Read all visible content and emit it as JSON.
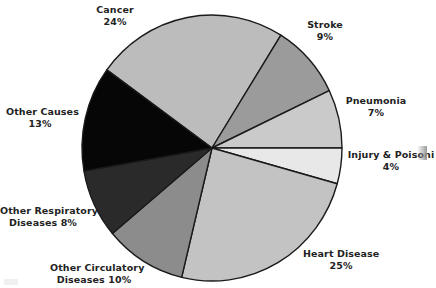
{
  "chart_data": {
    "type": "pie",
    "title": "",
    "slices": [
      {
        "label": "Cancer",
        "value": 24,
        "pct_label": "24%",
        "color": "#bcbcbc",
        "start": -144,
        "end": -58
      },
      {
        "label": "Stroke",
        "value": 9,
        "pct_label": "9%",
        "color": "#9b9b9b",
        "start": -58,
        "end": -25.6
      },
      {
        "label": "Pneumonia",
        "value": 7,
        "pct_label": "7%",
        "color": "#cacaca",
        "start": -25.6,
        "end": 0
      },
      {
        "label": "Injury & Poisoning",
        "value": 4,
        "pct_label": "4%",
        "color": "#e8e8e8",
        "start": 0,
        "end": 15.6
      },
      {
        "label": "Heart Disease",
        "value": 25,
        "pct_label": "25%",
        "color": "#c3c3c3",
        "start": 15.6,
        "end": 103.5
      },
      {
        "label": "Other Circulatory Diseases",
        "value": 10,
        "pct_label": "10%",
        "color": "#8c8c8c",
        "start": 103.5,
        "end": 140
      },
      {
        "label": "Other Respiratory Diseases",
        "value": 8,
        "pct_label": "8%",
        "color": "#2a2a2a",
        "start": 140,
        "end": 170
      },
      {
        "label": "Other Causes",
        "value": 13,
        "pct_label": "13%",
        "color": "#060606",
        "start": 170,
        "end": 216
      }
    ],
    "categories": [
      "Cancer",
      "Stroke",
      "Pneumonia",
      "Injury & Poisoning",
      "Heart Disease",
      "Other Circulatory Diseases",
      "Other Respiratory Diseases",
      "Other Causes"
    ],
    "values": [
      24,
      9,
      7,
      4,
      25,
      10,
      8,
      13
    ],
    "legend": "none (direct labels)"
  },
  "labels": {
    "cancer": {
      "name": "Cancer",
      "pct": "24%"
    },
    "stroke": {
      "name": "Stroke",
      "pct": "9%"
    },
    "pneumonia": {
      "name": "Pneumonia",
      "pct": "7%"
    },
    "injury": {
      "name": "Injury & Poisoni",
      "pct": "4%"
    },
    "heart": {
      "name": "Heart Disease",
      "pct": "25%"
    },
    "other_circ": {
      "line1": "Other Circulatory",
      "line2": "Diseases 10%"
    },
    "other_resp": {
      "line1": "Other Respiratory",
      "line2": "Diseases 8%"
    },
    "other_causes": {
      "name": "Other Causes",
      "pct": "13%"
    }
  }
}
